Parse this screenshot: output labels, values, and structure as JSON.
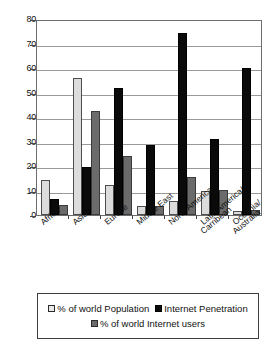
{
  "chart_data": {
    "type": "bar",
    "title": "",
    "xlabel": "",
    "ylabel": "",
    "ylim": [
      0,
      80
    ],
    "yticks": [
      0,
      10,
      20,
      30,
      40,
      50,
      60,
      70,
      80
    ],
    "grid": true,
    "legend_position": "bottom",
    "categories": [
      "Africa",
      "Asia",
      "Europe",
      "Middle East",
      "North America",
      "Latin America/ Carribean",
      "Oceania/ Australia"
    ],
    "category_lines": [
      [
        "Africa",
        ""
      ],
      [
        "Asia",
        ""
      ],
      [
        "Europe",
        ""
      ],
      [
        "Middle East",
        ""
      ],
      [
        "North America",
        ""
      ],
      [
        "Latin America/",
        "Carribean"
      ],
      [
        "Oceania/",
        "Australia"
      ]
    ],
    "series": [
      {
        "name": "% of world Population",
        "color": "#dcdcdc",
        "values": [
          14.6,
          56.4,
          12.4,
          3.7,
          5.9,
          9.7,
          1.7
        ]
      },
      {
        "name": "Internet Penetration",
        "color": "#0a0a0a",
        "values": [
          6.8,
          19.6,
          52.5,
          28.8,
          75.0,
          31.2,
          60.7
        ]
      },
      {
        "name": "% of world Internet users",
        "color": "#6b6b6b",
        "values": [
          4.0,
          43.0,
          24.4,
          3.9,
          15.5,
          10.5,
          2.2
        ]
      }
    ]
  },
  "legend": {
    "row1": [
      "% of world Population",
      "Internet Penetration"
    ],
    "row2": [
      "% of world Internet users"
    ]
  }
}
